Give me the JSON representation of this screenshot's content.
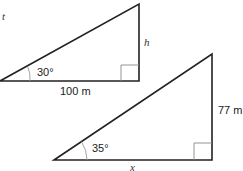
{
  "diagram": {
    "triangle_1": {
      "angle_label": "30°",
      "base_label": "100 m",
      "height_label": "h",
      "corner_label": "t",
      "right_angle": true
    },
    "triangle_2": {
      "angle_label": "35°",
      "base_label": "x",
      "height_label": "77 m",
      "right_angle": true
    },
    "colors": {
      "stroke": "#222222",
      "arc": "#999999",
      "right_angle_box": "#888888"
    }
  }
}
